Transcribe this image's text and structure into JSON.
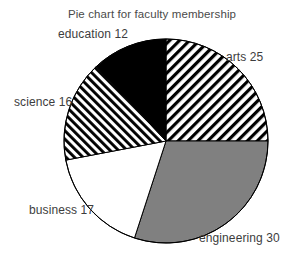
{
  "chart_data": {
    "type": "pie",
    "title": "Pie chart for faculty membership",
    "xlabel": "",
    "ylabel": "",
    "legend_position": "outside-labels",
    "grid": false,
    "total": 100,
    "categories": [
      "arts",
      "engineering",
      "business",
      "science",
      "education"
    ],
    "values": [
      25,
      30,
      17,
      16,
      12
    ],
    "labels": [
      "arts 25",
      "engineering 30",
      "business 17",
      "science 16",
      "education 12"
    ],
    "slices": [
      {
        "name": "arts",
        "value": 25,
        "label": "arts 25",
        "percent": 25,
        "start_angle_deg": 0,
        "end_angle_deg": 90,
        "fill_style": "diagonal-hatch-forward",
        "fill_color": "#000000",
        "background_color": "#ffffff"
      },
      {
        "name": "engineering",
        "value": 30,
        "label": "engineering 30",
        "percent": 30,
        "start_angle_deg": 90,
        "end_angle_deg": 198,
        "fill_style": "solid",
        "fill_color": "#808080",
        "background_color": "#808080"
      },
      {
        "name": "business",
        "value": 17,
        "label": "business 17",
        "percent": 17,
        "start_angle_deg": 198,
        "end_angle_deg": 259.2,
        "fill_style": "solid",
        "fill_color": "#ffffff",
        "background_color": "#ffffff"
      },
      {
        "name": "science",
        "value": 16,
        "label": "science 16",
        "percent": 16,
        "start_angle_deg": 259.2,
        "end_angle_deg": 316.8,
        "fill_style": "diagonal-hatch-backward",
        "fill_color": "#000000",
        "background_color": "#ffffff"
      },
      {
        "name": "education",
        "value": 12,
        "label": "education 12",
        "percent": 12,
        "start_angle_deg": 316.8,
        "end_angle_deg": 360,
        "fill_style": "solid",
        "fill_color": "#000000",
        "background_color": "#000000"
      }
    ],
    "geometry": {
      "center_x": 166,
      "center_y": 141,
      "radius": 102,
      "stroke_color": "#000000",
      "stroke_width": 1
    },
    "colors": {
      "outline": "#000000",
      "solid_gray": "#808080",
      "solid_black": "#000000",
      "solid_white": "#ffffff",
      "title_text": "#4a4a4a",
      "label_text": "#3d3d3d",
      "canvas": "#ffffff"
    }
  }
}
